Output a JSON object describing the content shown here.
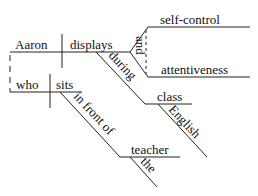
{
  "diagram": {
    "type": "sentence-diagram",
    "main_clause": {
      "subject": "Aaron",
      "verb": "displays",
      "conjunction": "and",
      "objects": [
        "self-control",
        "attentiveness"
      ],
      "prepositional_phrase": {
        "preposition": "during",
        "object": "class",
        "modifier": "English"
      }
    },
    "relative_clause": {
      "subject": "who",
      "verb": "sits",
      "prepositional_phrase": {
        "preposition": "in front of",
        "object": "teacher",
        "modifier": "the"
      }
    },
    "colors": {
      "line": "#222222",
      "text": "#111111",
      "background": "#ffffff"
    }
  }
}
